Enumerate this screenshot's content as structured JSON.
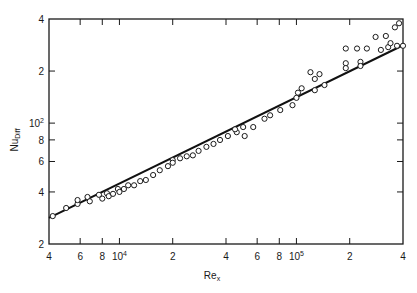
{
  "chart_data": {
    "type": "scatter",
    "title": "",
    "xlabel": "Re_x",
    "ylabel": "Nu_Diff",
    "xscale": "log",
    "yscale": "log",
    "xlim": [
      4000,
      400000
    ],
    "ylim": [
      20,
      400
    ],
    "grid": false,
    "legend": null,
    "x_ticks": [
      {
        "value": 4000,
        "label": "4"
      },
      {
        "value": 6000,
        "label": "6"
      },
      {
        "value": 8000,
        "label": "8"
      },
      {
        "value": 10000,
        "label": "10",
        "sup": "4"
      },
      {
        "value": 20000,
        "label": "2"
      },
      {
        "value": 40000,
        "label": "4"
      },
      {
        "value": 60000,
        "label": "6"
      },
      {
        "value": 80000,
        "label": "8"
      },
      {
        "value": 100000,
        "label": "10",
        "sup": "5"
      },
      {
        "value": 200000,
        "label": "2"
      },
      {
        "value": 400000,
        "label": "4"
      }
    ],
    "y_ticks": [
      {
        "value": 20,
        "label": "2"
      },
      {
        "value": 40,
        "label": "4"
      },
      {
        "value": 60,
        "label": "6"
      },
      {
        "value": 80,
        "label": "8"
      },
      {
        "value": 100,
        "label": "10",
        "sup": "2"
      },
      {
        "value": 200,
        "label": "2"
      },
      {
        "value": 400,
        "label": "4"
      }
    ],
    "series": [
      {
        "name": "data",
        "marker": "open-circle",
        "points": [
          [
            4200,
            29.0
          ],
          [
            5000,
            32.3
          ],
          [
            5800,
            34.1
          ],
          [
            5800,
            35.9
          ],
          [
            6600,
            37.4
          ],
          [
            6800,
            35.3
          ],
          [
            7660,
            38.5
          ],
          [
            8000,
            36.6
          ],
          [
            8500,
            39.3
          ],
          [
            8700,
            37.8
          ],
          [
            9200,
            39.0
          ],
          [
            9800,
            41.6
          ],
          [
            10000,
            40.0
          ],
          [
            10600,
            41.6
          ],
          [
            11200,
            43.7
          ],
          [
            12100,
            43.7
          ],
          [
            13100,
            46.2
          ],
          [
            14100,
            46.9
          ],
          [
            15500,
            50.1
          ],
          [
            16900,
            53.4
          ],
          [
            18800,
            56.4
          ],
          [
            20000,
            61.1
          ],
          [
            20000,
            59.0
          ],
          [
            22000,
            62.6
          ],
          [
            24000,
            64.3
          ],
          [
            26000,
            65.1
          ],
          [
            28000,
            69.1
          ],
          [
            31000,
            72.9
          ],
          [
            34000,
            75.8
          ],
          [
            37000,
            79.9
          ],
          [
            41000,
            84.2
          ],
          [
            46000,
            88.6
          ],
          [
            50000,
            94.9
          ],
          [
            45000,
            92.1
          ],
          [
            51000,
            84.2
          ],
          [
            57000,
            94.9
          ],
          [
            66000,
            106
          ],
          [
            71000,
            111
          ],
          [
            81000,
            119
          ],
          [
            95000,
            127
          ],
          [
            100000,
            140
          ],
          [
            102000,
            150
          ],
          [
            107000,
            159
          ],
          [
            120000,
            197
          ],
          [
            127000,
            180
          ],
          [
            135000,
            192
          ],
          [
            144000,
            166
          ],
          [
            127000,
            155
          ],
          [
            190000,
            270
          ],
          [
            190000,
            222
          ],
          [
            190000,
            208
          ],
          [
            220000,
            270
          ],
          [
            230000,
            226
          ],
          [
            230000,
            214
          ],
          [
            250000,
            270
          ],
          [
            280000,
            315
          ],
          [
            300000,
            265
          ],
          [
            320000,
            319
          ],
          [
            330000,
            275
          ],
          [
            340000,
            290
          ],
          [
            360000,
            358
          ],
          [
            380000,
            378
          ],
          [
            370000,
            280
          ],
          [
            400000,
            280
          ]
        ]
      },
      {
        "name": "correlation",
        "type": "line",
        "points": [
          [
            4000,
            28.3
          ],
          [
            400000,
            282
          ]
        ]
      }
    ]
  },
  "labels": {
    "xlabel_main": "Re",
    "xlabel_sub": "x",
    "ylabel_main": "Nu",
    "ylabel_sub": "Diff"
  }
}
